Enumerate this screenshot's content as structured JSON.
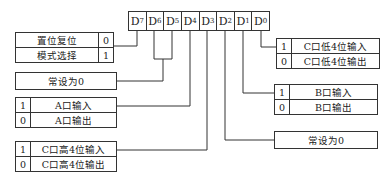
{
  "register": {
    "bits": [
      {
        "name": "D",
        "sub": "7"
      },
      {
        "name": "D",
        "sub": "6"
      },
      {
        "name": "D",
        "sub": "5"
      },
      {
        "name": "D",
        "sub": "4"
      },
      {
        "name": "D",
        "sub": "3"
      },
      {
        "name": "D",
        "sub": "2"
      },
      {
        "name": "D",
        "sub": "1"
      },
      {
        "name": "D",
        "sub": "0"
      }
    ]
  },
  "d7_table": {
    "rows": [
      {
        "label": "置位复位",
        "bit": "0"
      },
      {
        "label": "模式选择",
        "bit": "1"
      }
    ]
  },
  "d6d5_box": {
    "label": "常设为0"
  },
  "d4_table": {
    "rows": [
      {
        "bit": "1",
        "label": "A口输入"
      },
      {
        "bit": "0",
        "label": "A口输出"
      }
    ]
  },
  "d3_table": {
    "rows": [
      {
        "bit": "1",
        "label": "C口高4位输入"
      },
      {
        "bit": "0",
        "label": "C口高4位输出"
      }
    ]
  },
  "d0_table": {
    "rows": [
      {
        "bit": "1",
        "label": "C口低4位输入"
      },
      {
        "bit": "0",
        "label": "C口低4位输出"
      }
    ]
  },
  "d1_table": {
    "rows": [
      {
        "bit": "1",
        "label": "B口输入"
      },
      {
        "bit": "0",
        "label": "B口输出"
      }
    ]
  },
  "d2_box": {
    "label": "常设为0"
  }
}
